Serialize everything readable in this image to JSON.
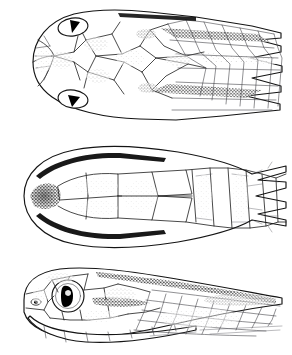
{
  "figure": {
    "technique": "pen-and-ink stipple line drawing",
    "background_color": "#ffffff",
    "ink_color": "#1c1c1c",
    "width_px": 292,
    "height_px": 355,
    "panel_count": 3
  },
  "panels": [
    {
      "id": "dorsal",
      "name": "Dorsal view of head",
      "label": "",
      "order": 1,
      "bbox": [
        14,
        8,
        282,
        124
      ],
      "orientation": "snout to the left, neck to the right",
      "eyes_visible": 2,
      "pupil_color": "#000000",
      "features": [
        "rostral",
        "internasals",
        "prefrontals",
        "frontal",
        "supraoculars",
        "parietals",
        "nuchal scales",
        "dorsal body scale rows"
      ],
      "pattern": "dark mottled stippling on head plates and two dark longitudinal paravertebral bands on the neck"
    },
    {
      "id": "ventral",
      "name": "Ventral view of head",
      "label": "",
      "order": 2,
      "bbox": [
        14,
        143,
        282,
        251
      ],
      "orientation": "snout to the left, throat and ventrals to the right",
      "eyes_visible": 0,
      "features": [
        "mental",
        "infralabials",
        "anterior chin shields",
        "posterior chin shields",
        "gular scales",
        "ventral plates"
      ],
      "pattern": "pale, unmarked; dark shading traces the lip margins and mental groove"
    },
    {
      "id": "lateral",
      "name": "Lateral view of head",
      "label": "",
      "order": 3,
      "bbox": [
        14,
        266,
        282,
        348
      ],
      "orientation": "snout to the left, facing left",
      "eyes_visible": 1,
      "pupil_shape": "vertical ellipse",
      "pupil_color": "#000000",
      "features": [
        "rostral",
        "nasal with nostril",
        "loreal",
        "preocular",
        "eye",
        "postoculars",
        "temporals",
        "supralabials",
        "infralabials",
        "lateral body scale rows"
      ],
      "pattern": "dark stippled stripe along the dorsum and a dark postocular streak across the temporals"
    }
  ],
  "caption": ""
}
